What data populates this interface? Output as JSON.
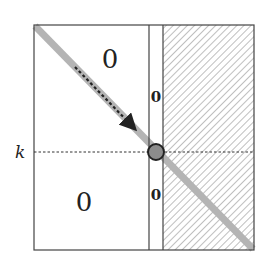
{
  "diagram": {
    "box": {
      "left": 34,
      "top": 25,
      "right": 254,
      "bottom": 250
    },
    "column_lines": {
      "x1": 149,
      "x2": 163
    },
    "k_line": {
      "y": 152,
      "label": "k"
    },
    "regions": [
      {
        "id": "top-left",
        "label": "0"
      },
      {
        "id": "bottom-left",
        "label": "0"
      },
      {
        "id": "column-top",
        "label": "0"
      },
      {
        "id": "column-bottom",
        "label": "0"
      }
    ],
    "hatched_region": {
      "description": "hatched right region"
    },
    "diagonal": {
      "color": "#b0b0b0"
    },
    "arrow": {
      "style": "dashed",
      "color": "#222222"
    },
    "circle": {
      "cx": 156,
      "cy": 152,
      "r": 8,
      "fill": "#888888",
      "stroke": "#222222"
    },
    "colors": {
      "line": "#333333",
      "hatch": "#888888"
    }
  }
}
